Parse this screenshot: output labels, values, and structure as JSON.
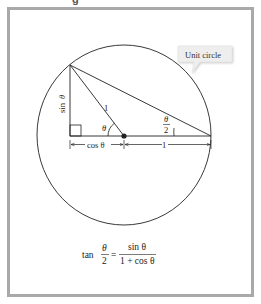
{
  "header": {
    "partial_text": "g"
  },
  "figure": {
    "callout": {
      "label": "Unit circle"
    },
    "labels": {
      "sin": "sin",
      "theta": "θ",
      "one_hyp": "1",
      "cos_label": "cos θ",
      "one_base": "1",
      "half_num": "θ",
      "half_den": "2"
    },
    "formula": {
      "lhs_func": "tan",
      "lhs_num": "θ",
      "lhs_den": "2",
      "equals": "=",
      "rhs_num": "sin θ",
      "rhs_den": "1 + cos θ"
    },
    "colors": {
      "frame": "#a9a9a9",
      "line": "#222222",
      "callout_bg": "#eeeeee"
    }
  }
}
